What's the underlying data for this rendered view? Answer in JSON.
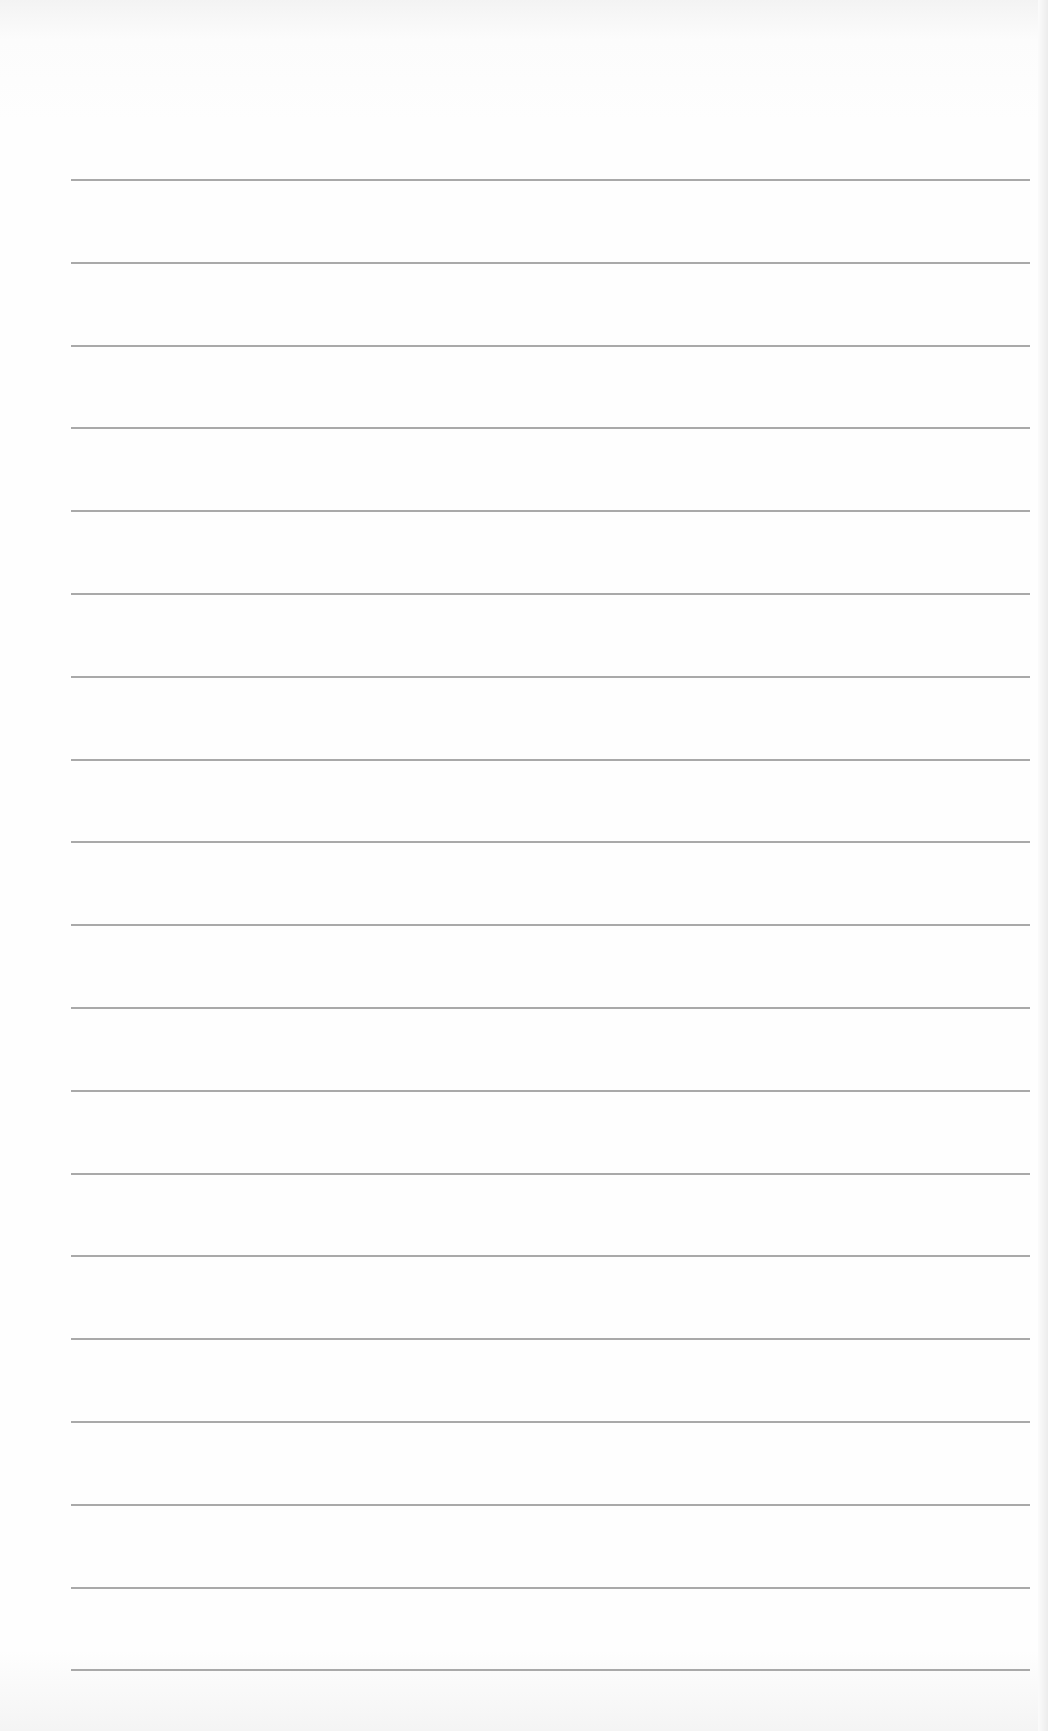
{
  "page": {
    "type": "ruled-notebook-page",
    "background_color": "#fefefe",
    "rule_color": "#9a9a9a",
    "rule_count": 19,
    "rule_left_px": 71,
    "rule_right_px": 1030,
    "first_rule_y_px": 179,
    "rule_spacing_px": 82.8,
    "text_lines": []
  }
}
